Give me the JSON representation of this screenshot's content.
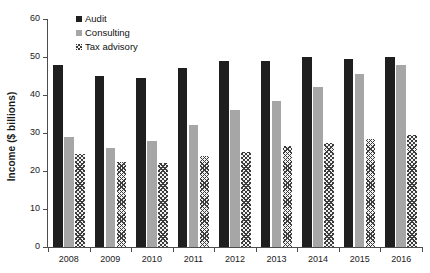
{
  "chart_data": {
    "type": "bar",
    "title": "",
    "subtitle": "",
    "xlabel": "",
    "ylabel": "Income ($ billions)",
    "categories": [
      "2008",
      "2009",
      "2010",
      "2011",
      "2012",
      "2013",
      "2014",
      "2015",
      "2016"
    ],
    "series": [
      {
        "name": "Audit",
        "color": "#1f1f1f",
        "pattern": "solid",
        "values": [
          48,
          45,
          44.5,
          47,
          49,
          49,
          50,
          49.5,
          50
        ]
      },
      {
        "name": "Consulting",
        "color": "#a6a6a6",
        "pattern": "solid",
        "values": [
          29,
          26,
          28,
          32,
          36,
          38.5,
          42,
          45.5,
          48
        ]
      },
      {
        "name": "Tax advisory",
        "color": "#f2f2f2",
        "pattern": "crosshatch",
        "values": [
          24.5,
          22.5,
          22,
          24,
          25,
          26.5,
          27.5,
          28.5,
          29.5
        ]
      }
    ],
    "ylim": [
      0,
      60
    ],
    "ytick_values": [
      0,
      10,
      20,
      30,
      40,
      50,
      60
    ],
    "ytick_labels": [
      "0",
      "10",
      "20",
      "30",
      "40",
      "50",
      "60"
    ],
    "grid": false,
    "legend_position": "top-left-inside",
    "legend_entries": [
      "Audit",
      "Consulting",
      "Tax advisory"
    ]
  },
  "axis": {
    "y_title": "Income ($ billions)"
  }
}
